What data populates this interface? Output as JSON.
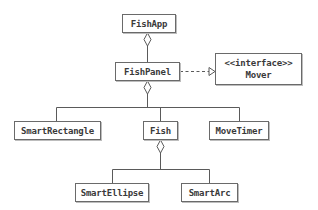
{
  "diagram": {
    "type": "UML class diagram",
    "classes": [
      {
        "id": "fishapp",
        "name": "FishApp",
        "x": 122,
        "y": 14,
        "w": 54,
        "h": 19
      },
      {
        "id": "fishpanel",
        "name": "FishPanel",
        "x": 115,
        "y": 62,
        "w": 65,
        "h": 19
      },
      {
        "id": "mover",
        "stereotype": "<<interface>>",
        "name": "Mover",
        "x": 215,
        "y": 53,
        "w": 87,
        "h": 32
      },
      {
        "id": "smartrectangle",
        "name": "SmartRectangle",
        "x": 14,
        "y": 121,
        "w": 87,
        "h": 19
      },
      {
        "id": "fish",
        "name": "Fish",
        "x": 143,
        "y": 121,
        "w": 35,
        "h": 19
      },
      {
        "id": "movetimer",
        "name": "MoveTimer",
        "x": 209,
        "y": 121,
        "w": 60,
        "h": 19
      },
      {
        "id": "smartellipse",
        "name": "SmartEllipse",
        "x": 75,
        "y": 183,
        "w": 74,
        "h": 19
      },
      {
        "id": "smartarc",
        "name": "SmartArc",
        "x": 181,
        "y": 183,
        "w": 57,
        "h": 19
      }
    ],
    "relationships": [
      {
        "type": "aggregation",
        "whole": "FishApp",
        "part": "FishPanel"
      },
      {
        "type": "realization",
        "from": "FishPanel",
        "to": "Mover"
      },
      {
        "type": "aggregation",
        "whole": "FishPanel",
        "part": "SmartRectangle"
      },
      {
        "type": "aggregation",
        "whole": "FishPanel",
        "part": "Fish"
      },
      {
        "type": "aggregation",
        "whole": "FishPanel",
        "part": "MoveTimer"
      },
      {
        "type": "aggregation",
        "whole": "Fish",
        "part": "SmartEllipse"
      },
      {
        "type": "aggregation",
        "whole": "Fish",
        "part": "SmartArc"
      }
    ],
    "colors": {
      "line": "#5a5a5a",
      "box_border": "#6a6a6a",
      "text": "#3a3a3a",
      "background": "#ffffff"
    }
  }
}
